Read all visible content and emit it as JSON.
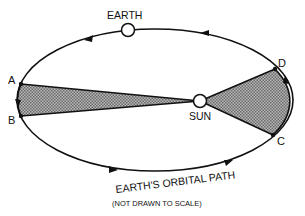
{
  "diagram": {
    "labels": {
      "earth": "EARTH",
      "sun": "SUN",
      "orbital_path": "EARTH'S ORBITAL PATH",
      "scale_note": "(NOT DRAWN TO SCALE)",
      "point_a": "A",
      "point_b": "B",
      "point_c": "C",
      "point_d": "D"
    },
    "colors": {
      "line": "#111111",
      "shaded_area": "#9a9a9a",
      "background": "#ffffff"
    },
    "orbit": {
      "cx": 155,
      "cy": 100,
      "rx": 138,
      "ry": 71
    },
    "sun": {
      "x": 200,
      "y": 101,
      "r": 6
    },
    "earth": {
      "x": 128,
      "y": 30,
      "r": 6
    },
    "points": {
      "A": {
        "x": 21,
        "y": 84
      },
      "B": {
        "x": 21,
        "y": 116
      },
      "C": {
        "x": 273,
        "y": 135
      },
      "D": {
        "x": 275,
        "y": 69
      }
    },
    "shaded_regions": [
      {
        "name": "sector-AB",
        "from": "A",
        "to": "B",
        "vertex": "SUN"
      },
      {
        "name": "sector-CD",
        "from": "C",
        "to": "D",
        "vertex": "SUN"
      }
    ]
  }
}
